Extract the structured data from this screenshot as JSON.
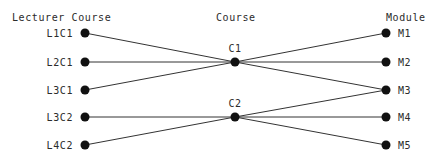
{
  "diagram": {
    "width": 434,
    "height": 162,
    "background_color": "#ffffff",
    "node_color": "#111111",
    "edge_color": "#333333",
    "text_color": "#2b2b2b"
  },
  "columns": [
    {
      "id": "left",
      "header": "Lecturer Course",
      "header_x": 12,
      "header_y": 12
    },
    {
      "id": "middle",
      "header": "Course",
      "header_x": 216,
      "header_y": 12
    },
    {
      "id": "right",
      "header": "Module",
      "header_x": 386,
      "header_y": 12
    }
  ],
  "nodes": {
    "left": [
      {
        "id": "L1C1",
        "label": "L1C1",
        "x": 85,
        "y": 33
      },
      {
        "id": "L2C1",
        "label": "L2C1",
        "x": 85,
        "y": 62
      },
      {
        "id": "L3C1",
        "label": "L3C1",
        "x": 85,
        "y": 90
      },
      {
        "id": "L3C2",
        "label": "L3C2",
        "x": 85,
        "y": 117
      },
      {
        "id": "L4C2",
        "label": "L4C2",
        "x": 85,
        "y": 145
      }
    ],
    "middle": [
      {
        "id": "C1",
        "label": "C1",
        "x": 235,
        "y": 62
      },
      {
        "id": "C2",
        "label": "C2",
        "x": 235,
        "y": 117
      }
    ],
    "right": [
      {
        "id": "M1",
        "label": "M1",
        "x": 386,
        "y": 33
      },
      {
        "id": "M2",
        "label": "M2",
        "x": 386,
        "y": 62
      },
      {
        "id": "M3",
        "label": "M3",
        "x": 386,
        "y": 90
      },
      {
        "id": "M4",
        "label": "M4",
        "x": 386,
        "y": 117
      },
      {
        "id": "M5",
        "label": "M5",
        "x": 386,
        "y": 145
      }
    ]
  },
  "edges": [
    {
      "from": "L1C1",
      "to": "C1",
      "x1": 85,
      "y1": 33,
      "x2": 235,
      "y2": 62
    },
    {
      "from": "L2C1",
      "to": "C1",
      "x1": 85,
      "y1": 62,
      "x2": 235,
      "y2": 62
    },
    {
      "from": "L3C1",
      "to": "C1",
      "x1": 85,
      "y1": 90,
      "x2": 235,
      "y2": 62
    },
    {
      "from": "L3C2",
      "to": "C2",
      "x1": 85,
      "y1": 117,
      "x2": 235,
      "y2": 117
    },
    {
      "from": "L4C2",
      "to": "C2",
      "x1": 85,
      "y1": 145,
      "x2": 235,
      "y2": 117
    },
    {
      "from": "C1",
      "to": "M1",
      "x1": 235,
      "y1": 62,
      "x2": 386,
      "y2": 33
    },
    {
      "from": "C1",
      "to": "M2",
      "x1": 235,
      "y1": 62,
      "x2": 386,
      "y2": 62
    },
    {
      "from": "C1",
      "to": "M3",
      "x1": 235,
      "y1": 62,
      "x2": 386,
      "y2": 90
    },
    {
      "from": "C2",
      "to": "M3",
      "x1": 235,
      "y1": 117,
      "x2": 386,
      "y2": 90
    },
    {
      "from": "C2",
      "to": "M4",
      "x1": 235,
      "y1": 117,
      "x2": 386,
      "y2": 117
    },
    {
      "from": "C2",
      "to": "M5",
      "x1": 235,
      "y1": 117,
      "x2": 386,
      "y2": 145
    }
  ]
}
